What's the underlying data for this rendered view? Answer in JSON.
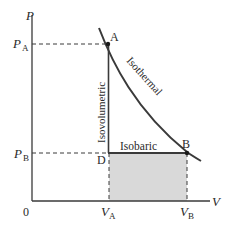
{
  "diagram": {
    "type": "PV diagram",
    "axes": {
      "y_label": "P",
      "x_label": "V",
      "origin_label": "0"
    },
    "ticks": {
      "pa_main": "P",
      "pa_sub": "A",
      "pb_main": "P",
      "pb_sub": "B",
      "va_main": "V",
      "va_sub": "A",
      "vb_main": "V",
      "vb_sub": "B"
    },
    "points": {
      "a": "A",
      "b": "B",
      "d": "D"
    },
    "processes": {
      "isothermal": "Isothermal",
      "isovolumetric": "Isovolumetric",
      "isobaric": "Isobaric"
    },
    "colors": {
      "line": "#3a3a3a",
      "shade": "#d9d9d9",
      "dash": "#3a3a3a"
    }
  }
}
